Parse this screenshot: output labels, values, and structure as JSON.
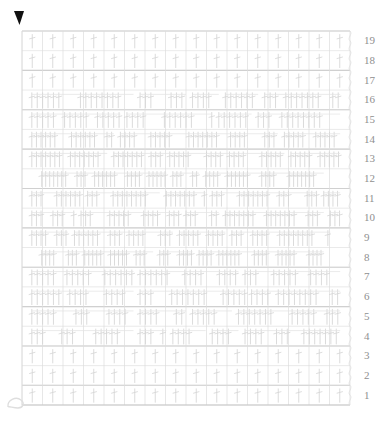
{
  "document": {
    "type": "crochet-stitch-chart",
    "title": "Crochet Pattern Chart",
    "background_color": "#ffffff",
    "ink_color": "#d4d4d4",
    "grid_line_color": "#dcdcdc",
    "major_line_color": "#d0d0d0",
    "number_color": "#8f8f8f",
    "marker_color": "#111111"
  },
  "canvas": {
    "width": 389,
    "height": 423
  },
  "grid": {
    "left": 22,
    "top": 31,
    "right": 350,
    "bottom": 405,
    "columns": 16,
    "rows": 19,
    "cell_width": 20.5,
    "cell_height": 19.7,
    "show_grid": true
  },
  "cursor_marker": {
    "name": "triangle-pointer",
    "glyph": "▼",
    "x": 19,
    "y": 11,
    "color": "#111111",
    "label": "▼"
  },
  "bottom_left_mark": {
    "name": "chain-loop-mark",
    "x": 8,
    "y": 398,
    "color": "#dedede"
  },
  "edge_chain": {
    "name": "right-edge-chain",
    "x": 350,
    "from_y": 31,
    "to_y": 405,
    "segments": 38,
    "color": "#dddddd"
  },
  "row_numbers": {
    "side": "right",
    "x": 364,
    "order": "bottom-to-top",
    "labels": [
      "19",
      "18",
      "17",
      "16",
      "15",
      "14",
      "13",
      "12",
      "11",
      "10",
      "9",
      "8",
      "7",
      "6",
      "5",
      "4",
      "3",
      "2",
      "1"
    ]
  },
  "chart_data": {
    "type": "heatmap",
    "xlabel": "",
    "ylabel": "Row",
    "grid": true,
    "legend_position": "none",
    "x": [
      1,
      2,
      3,
      4,
      5,
      6,
      7,
      8,
      9,
      10,
      11,
      12,
      13,
      14,
      15,
      16
    ],
    "categories": [
      "19",
      "18",
      "17",
      "16",
      "15",
      "14",
      "13",
      "12",
      "11",
      "10",
      "9",
      "8",
      "7",
      "6",
      "5",
      "4",
      "3",
      "2",
      "1"
    ],
    "ylim": [
      1,
      19
    ],
    "series": [
      {
        "name": "row-19",
        "row": 19,
        "density": "sparse",
        "stitch_count": 16,
        "clusters": [
          [
            0.03,
            0.97
          ]
        ]
      },
      {
        "name": "row-18",
        "row": 18,
        "density": "sparse",
        "stitch_count": 16,
        "clusters": [
          [
            0.03,
            0.97
          ]
        ]
      },
      {
        "name": "row-17",
        "row": 17,
        "density": "sparse",
        "stitch_count": 16,
        "clusters": [
          [
            0.03,
            0.97
          ]
        ]
      },
      {
        "name": "row-16",
        "row": 16,
        "density": "mixed",
        "stitch_count": 30,
        "clusters": [
          [
            0.03,
            0.34
          ],
          [
            0.36,
            0.5
          ],
          [
            0.52,
            0.6
          ],
          [
            0.62,
            0.72
          ],
          [
            0.74,
            0.97
          ]
        ]
      },
      {
        "name": "row-15",
        "row": 15,
        "density": "mixed",
        "stitch_count": 34,
        "clusters": [
          [
            0.03,
            0.3
          ],
          [
            0.32,
            0.58
          ],
          [
            0.6,
            0.7
          ],
          [
            0.72,
            0.97
          ]
        ]
      },
      {
        "name": "row-14",
        "row": 14,
        "density": "dense",
        "stitch_count": 44,
        "clusters": [
          [
            0.03,
            0.28
          ],
          [
            0.3,
            0.78
          ],
          [
            0.8,
            0.97
          ]
        ]
      },
      {
        "name": "row-13",
        "row": 13,
        "density": "dense",
        "stitch_count": 46,
        "clusters": [
          [
            0.03,
            0.26
          ],
          [
            0.28,
            0.8
          ],
          [
            0.82,
            0.97
          ]
        ]
      },
      {
        "name": "row-12",
        "row": 12,
        "density": "very-dense",
        "stitch_count": 58,
        "clusters": [
          [
            0.06,
            0.44
          ],
          [
            0.46,
            0.54
          ],
          [
            0.56,
            0.92
          ]
        ]
      },
      {
        "name": "row-11",
        "row": 11,
        "density": "dense",
        "stitch_count": 48,
        "clusters": [
          [
            0.03,
            0.18
          ],
          [
            0.2,
            0.42
          ],
          [
            0.44,
            0.56
          ],
          [
            0.58,
            0.9
          ],
          [
            0.92,
            0.97
          ]
        ]
      },
      {
        "name": "row-10",
        "row": 10,
        "density": "dense",
        "stitch_count": 50,
        "clusters": [
          [
            0.03,
            0.16
          ],
          [
            0.18,
            0.48
          ],
          [
            0.5,
            0.6
          ],
          [
            0.62,
            0.92
          ],
          [
            0.94,
            0.97
          ]
        ]
      },
      {
        "name": "row-9",
        "row": 9,
        "density": "dense",
        "stitch_count": 50,
        "clusters": [
          [
            0.03,
            0.14
          ],
          [
            0.16,
            0.46
          ],
          [
            0.48,
            0.62
          ],
          [
            0.64,
            0.94
          ]
        ]
      },
      {
        "name": "row-8",
        "row": 8,
        "density": "very-dense",
        "stitch_count": 60,
        "clusters": [
          [
            0.06,
            0.4
          ],
          [
            0.42,
            0.52
          ],
          [
            0.54,
            0.92
          ]
        ]
      },
      {
        "name": "row-7",
        "row": 7,
        "density": "mixed",
        "stitch_count": 36,
        "clusters": [
          [
            0.03,
            0.34
          ],
          [
            0.36,
            0.66
          ],
          [
            0.68,
            0.97
          ]
        ]
      },
      {
        "name": "row-6",
        "row": 6,
        "density": "mixed",
        "stitch_count": 36,
        "clusters": [
          [
            0.03,
            0.34
          ],
          [
            0.36,
            0.68
          ],
          [
            0.7,
            0.97
          ]
        ]
      },
      {
        "name": "row-5",
        "row": 5,
        "density": "mixed",
        "stitch_count": 34,
        "clusters": [
          [
            0.03,
            0.34
          ],
          [
            0.36,
            0.5
          ],
          [
            0.52,
            0.64
          ],
          [
            0.66,
            0.97
          ]
        ]
      },
      {
        "name": "row-4",
        "row": 4,
        "density": "mixed",
        "stitch_count": 26,
        "clusters": [
          [
            0.03,
            0.34
          ],
          [
            0.36,
            0.44
          ],
          [
            0.46,
            0.56
          ],
          [
            0.58,
            0.66
          ],
          [
            0.68,
            0.97
          ]
        ]
      },
      {
        "name": "row-3",
        "row": 3,
        "density": "sparse",
        "stitch_count": 16,
        "clusters": [
          [
            0.03,
            0.97
          ]
        ]
      },
      {
        "name": "row-2",
        "row": 2,
        "density": "sparse",
        "stitch_count": 16,
        "clusters": [
          [
            0.03,
            0.97
          ]
        ]
      },
      {
        "name": "row-1",
        "row": 1,
        "density": "sparse",
        "stitch_count": 16,
        "clusters": [
          [
            0.03,
            0.97
          ]
        ]
      }
    ]
  }
}
